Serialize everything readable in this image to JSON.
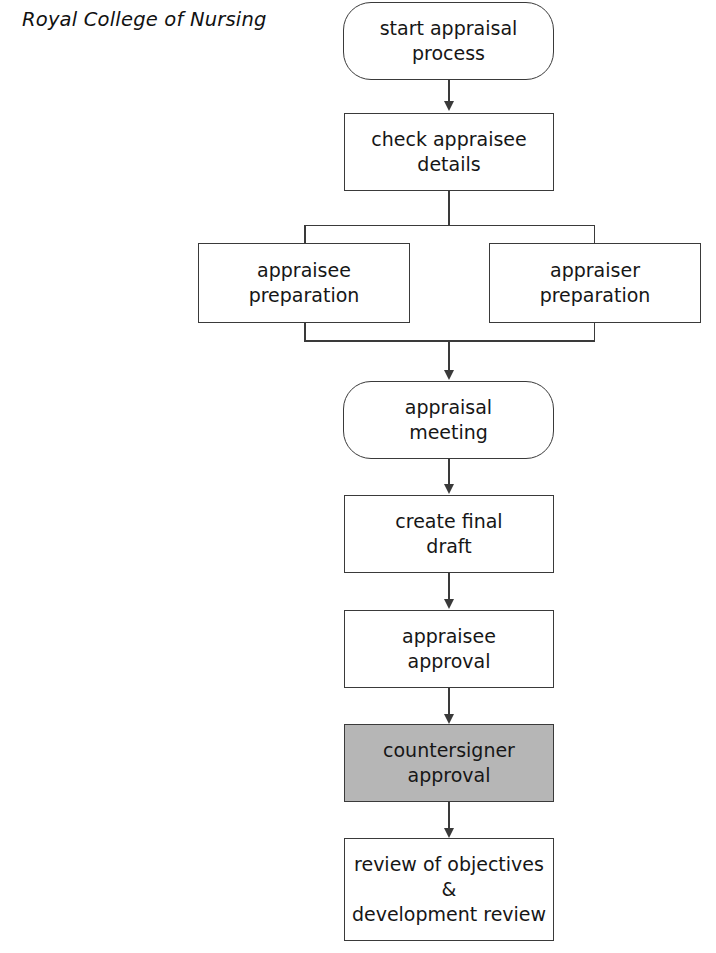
{
  "header": {
    "title": "Royal College of Nursing"
  },
  "diagram": {
    "type": "flowchart",
    "orientation": "top-to-bottom",
    "colors": {
      "stroke": "#3a3a3a",
      "node_fill": "#ffffff",
      "highlight_fill": "#b6b6b6",
      "text": "#161616"
    },
    "nodes": [
      {
        "id": "start",
        "shape": "stadium",
        "lines": [
          "start appraisal",
          "process"
        ],
        "shaded": false
      },
      {
        "id": "check-details",
        "shape": "rectangle",
        "lines": [
          "check appraisee",
          "details"
        ],
        "shaded": false
      },
      {
        "id": "appraisee-preparation",
        "shape": "rectangle",
        "lines": [
          "appraisee",
          "preparation"
        ],
        "shaded": false
      },
      {
        "id": "appraiser-preparation",
        "shape": "rectangle",
        "lines": [
          "appraiser",
          "preparation"
        ],
        "shaded": false
      },
      {
        "id": "appraisal-meeting",
        "shape": "stadium",
        "lines": [
          "appraisal",
          "meeting"
        ],
        "shaded": false
      },
      {
        "id": "create-final-draft",
        "shape": "rectangle",
        "lines": [
          "create final",
          "draft"
        ],
        "shaded": false
      },
      {
        "id": "appraisee-approval",
        "shape": "rectangle",
        "lines": [
          "appraisee",
          "approval"
        ],
        "shaded": false
      },
      {
        "id": "countersigner-approval",
        "shape": "rectangle",
        "lines": [
          "countersigner",
          "approval"
        ],
        "shaded": true
      },
      {
        "id": "review-objectives",
        "shape": "rectangle",
        "lines": [
          "review of objectives",
          "&",
          "development review"
        ],
        "shaded": false
      }
    ],
    "edges": [
      {
        "from": "start",
        "to": "check-details",
        "arrow": true
      },
      {
        "from": "check-details",
        "to": "appraisee-preparation",
        "arrow": false
      },
      {
        "from": "check-details",
        "to": "appraiser-preparation",
        "arrow": false
      },
      {
        "from": "appraisee-preparation",
        "to": "appraisal-meeting",
        "arrow": true
      },
      {
        "from": "appraiser-preparation",
        "to": "appraisal-meeting",
        "arrow": true
      },
      {
        "from": "appraisal-meeting",
        "to": "create-final-draft",
        "arrow": true
      },
      {
        "from": "create-final-draft",
        "to": "appraisee-approval",
        "arrow": true
      },
      {
        "from": "appraisee-approval",
        "to": "countersigner-approval",
        "arrow": true
      },
      {
        "from": "countersigner-approval",
        "to": "review-objectives",
        "arrow": true
      }
    ]
  }
}
